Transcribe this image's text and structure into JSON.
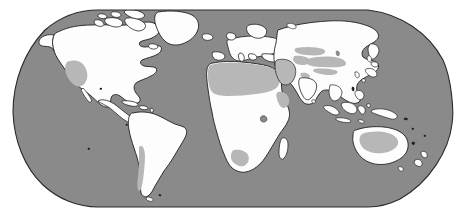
{
  "figure": {
    "kind": "world-map",
    "projection": "Robinson",
    "width": 465,
    "height": 223,
    "background_color": "#ffffff"
  },
  "legend": {
    "ocean_label": "Ocean",
    "land_label": "Land",
    "arid_label": "Arid / Desert region",
    "coastline_label": "Coastline"
  },
  "colors": {
    "background": "#ffffff",
    "ocean": "#8a8a8a",
    "land": "#fdfdfd",
    "arid": "#b7b7b7",
    "coastline": "#231f20",
    "frame": "#2b2b2b"
  },
  "frame": {
    "top_y": 10,
    "bottom_y": 207,
    "left_x": 13,
    "right_x": 452,
    "top_left_x": 98,
    "top_right_x": 368,
    "stroke_width": 1.1
  },
  "regions": [
    {
      "id": "north-america",
      "name": "North America",
      "fill": "land"
    },
    {
      "id": "greenland",
      "name": "Greenland",
      "fill": "land"
    },
    {
      "id": "arctic-archipelago",
      "name": "Canadian Arctic Archipelago",
      "fill": "land"
    },
    {
      "id": "central-america",
      "name": "Central America",
      "fill": "land"
    },
    {
      "id": "caribbean",
      "name": "Caribbean Islands",
      "fill": "land"
    },
    {
      "id": "south-america",
      "name": "South America",
      "fill": "land"
    },
    {
      "id": "africa",
      "name": "Africa",
      "fill": "land"
    },
    {
      "id": "europe",
      "name": "Europe",
      "fill": "land"
    },
    {
      "id": "asia",
      "name": "Asia",
      "fill": "land"
    },
    {
      "id": "southeast-asia-islands",
      "name": "Southeast Asian Archipelago",
      "fill": "land"
    },
    {
      "id": "japan",
      "name": "Japan",
      "fill": "land"
    },
    {
      "id": "new-guinea",
      "name": "New Guinea",
      "fill": "land"
    },
    {
      "id": "australia",
      "name": "Australia",
      "fill": "land"
    },
    {
      "id": "new-zealand",
      "name": "New Zealand",
      "fill": "land"
    },
    {
      "id": "british-isles",
      "name": "British Isles",
      "fill": "land"
    },
    {
      "id": "madagascar",
      "name": "Madagascar",
      "fill": "land"
    },
    {
      "id": "iceland",
      "name": "Iceland",
      "fill": "land"
    },
    {
      "id": "sri-lanka",
      "name": "Sri Lanka",
      "fill": "land"
    }
  ],
  "arid_regions": [
    {
      "id": "sahara",
      "name": "Sahara Desert",
      "fill": "arid"
    },
    {
      "id": "arabian-peninsula",
      "name": "Arabian Peninsula",
      "fill": "arid"
    },
    {
      "id": "southwest-us",
      "name": "Southwestern United States",
      "fill": "arid"
    },
    {
      "id": "gobi-taklamakan",
      "name": "Gobi and Taklamakan Deserts",
      "fill": "arid"
    },
    {
      "id": "central-asia-steppe",
      "name": "Central Asian Steppe",
      "fill": "arid"
    },
    {
      "id": "australian-outback",
      "name": "Australian Outback",
      "fill": "arid"
    },
    {
      "id": "kalahari",
      "name": "Kalahari Desert",
      "fill": "arid"
    },
    {
      "id": "atacama-patagonia",
      "name": "Atacama and Patagonia",
      "fill": "arid"
    },
    {
      "id": "iran-plateau",
      "name": "Iranian Plateau",
      "fill": "arid"
    },
    {
      "id": "thar",
      "name": "Thar Desert",
      "fill": "arid"
    },
    {
      "id": "horn-of-africa",
      "name": "Horn of Africa",
      "fill": "arid"
    }
  ]
}
